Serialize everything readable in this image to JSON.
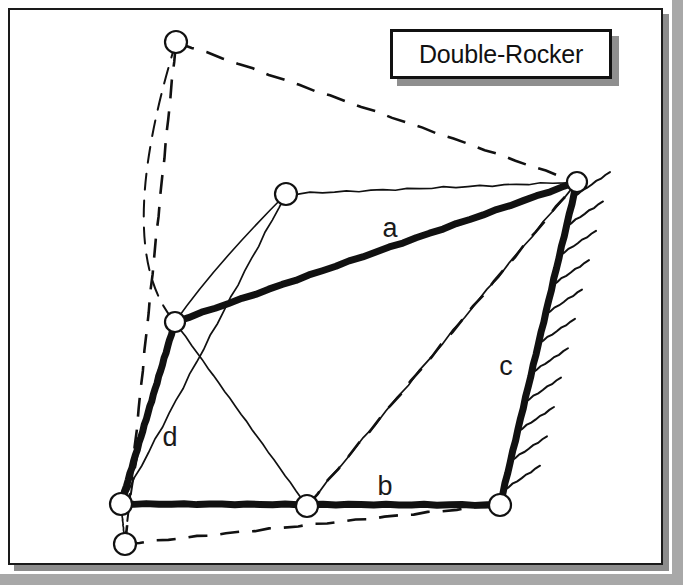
{
  "figure": {
    "title_label": "Double-Rocker",
    "background_color": "#a8a8a8",
    "paper_color": "#ffffff",
    "ink_color": "#111111",
    "frame": {
      "x": 8,
      "y": 8,
      "width": 655,
      "height": 557,
      "border_width": 2
    },
    "title_box": {
      "x": 390,
      "y": 29,
      "width": 222,
      "height": 50,
      "shadow_offset": 7
    }
  },
  "link_labels": [
    {
      "name": "a",
      "text": "a",
      "x": 390,
      "y": 228
    },
    {
      "name": "b",
      "text": "b",
      "x": 385,
      "y": 486
    },
    {
      "name": "c",
      "text": "c",
      "x": 506,
      "y": 366
    },
    {
      "name": "d",
      "text": "d",
      "x": 170,
      "y": 437
    }
  ],
  "joints": [
    {
      "name": "ground-left-pivot",
      "x": 121,
      "y": 504,
      "r": 11,
      "style": "solid"
    },
    {
      "name": "ground-right-pivot",
      "x": 500,
      "y": 505,
      "r": 11,
      "style": "solid"
    },
    {
      "name": "coupler-left-joint",
      "x": 175,
      "y": 322,
      "r": 10,
      "style": "solid"
    },
    {
      "name": "coupler-right-joint",
      "x": 577,
      "y": 182,
      "r": 10,
      "style": "solid"
    },
    {
      "name": "alt-pos-top-joint",
      "x": 176,
      "y": 42,
      "r": 11,
      "style": "dashed-pos"
    },
    {
      "name": "alt-pos-mid-joint",
      "x": 286,
      "y": 194,
      "r": 11,
      "style": "dashed-pos"
    },
    {
      "name": "alt-pos-bottom-joint",
      "x": 307,
      "y": 506,
      "r": 11,
      "style": "dashed-pos"
    },
    {
      "name": "alt-pos-lower-left-joint",
      "x": 125,
      "y": 544,
      "r": 11,
      "style": "dashed-pos"
    }
  ],
  "solid_links": [
    {
      "name": "link-a-coupler",
      "from": [
        175,
        322
      ],
      "to": [
        577,
        182
      ],
      "width": 7
    },
    {
      "name": "link-b-ground",
      "from": [
        121,
        504
      ],
      "to": [
        500,
        505
      ],
      "width": 7
    },
    {
      "name": "link-c-right-rocker",
      "from": [
        500,
        505
      ],
      "to": [
        577,
        182
      ],
      "width": 7
    },
    {
      "name": "link-d-left-rocker",
      "from": [
        121,
        504
      ],
      "to": [
        175,
        322
      ],
      "width": 7
    }
  ],
  "dashed_links": [
    {
      "name": "alt-link-a-dashed",
      "from": [
        176,
        42
      ],
      "to": [
        577,
        182
      ]
    },
    {
      "name": "alt-link-c-dashed",
      "from": [
        307,
        506
      ],
      "to": [
        577,
        182
      ]
    },
    {
      "name": "alt-link-d-dashed",
      "from": [
        125,
        544
      ],
      "to": [
        176,
        42
      ]
    },
    {
      "name": "alt-link-b-dashed",
      "from": [
        125,
        544
      ],
      "to": [
        500,
        505
      ]
    }
  ],
  "thin_links": [
    {
      "name": "mid-pos-link-a",
      "from": [
        286,
        194
      ],
      "to": [
        577,
        182
      ]
    },
    {
      "name": "mid-pos-link-d",
      "from": [
        121,
        504
      ],
      "to": [
        286,
        194
      ]
    },
    {
      "name": "mid-pos-link-c",
      "from": [
        307,
        506
      ],
      "to": [
        577,
        182
      ]
    },
    {
      "name": "mid-pos-link-b-left",
      "from": [
        121,
        504
      ],
      "to": [
        307,
        506
      ]
    },
    {
      "name": "ground-link-vertical",
      "from": [
        121,
        504
      ],
      "to": [
        125,
        544
      ]
    },
    {
      "name": "alt-coupler-tie",
      "from": [
        175,
        322
      ],
      "to": [
        307,
        506
      ]
    }
  ],
  "arcs": [
    {
      "name": "left-rocker-path-arc",
      "start": [
        176,
        42
      ],
      "control": [
        112,
        250
      ],
      "end": [
        175,
        322
      ],
      "style": "dashed"
    },
    {
      "name": "left-rocker-path-arc-lower",
      "start": [
        175,
        322
      ],
      "control": [
        135,
        430
      ],
      "end": [
        125,
        544
      ],
      "style": "dashed"
    },
    {
      "name": "coupler-path-arc",
      "start": [
        286,
        194
      ],
      "control": [
        215,
        265
      ],
      "end": [
        175,
        322
      ],
      "style": "thin"
    }
  ],
  "ground_hatch": {
    "name": "ground-hatching",
    "along": {
      "from": [
        577,
        182
      ],
      "to": [
        500,
        505
      ]
    },
    "tick_count": 11,
    "tick_length": 44,
    "tick_angle_deg": -34
  },
  "ground_hatch_bottom": {
    "name": "ground-hatching-bottom",
    "visible": false
  }
}
